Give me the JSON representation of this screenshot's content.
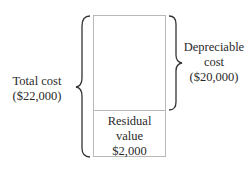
{
  "diagram": {
    "total_cost": {
      "line1": "Total cost",
      "line2": "($22,000)"
    },
    "depreciable_cost": {
      "line1": "Depreciable",
      "line2": "cost",
      "line3": "($20,000)"
    },
    "residual_value": {
      "line1": "Residual",
      "line2": "value",
      "line3": "$2,000"
    }
  }
}
